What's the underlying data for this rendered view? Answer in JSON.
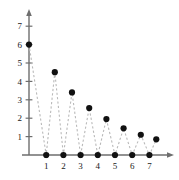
{
  "chart_data": {
    "type": "scatter",
    "title": "",
    "subtitle": "",
    "xlabel": "",
    "ylabel": "",
    "xlim": [
      0,
      7.7
    ],
    "ylim": [
      0,
      7.4
    ],
    "grid": false,
    "legend": null,
    "line_style": "dashed",
    "line_color": "#b9b9b9",
    "marker": "filled-circle",
    "marker_color": "#111111",
    "axis_color": "#6e6e6e",
    "x_ticks": [
      1,
      2,
      3,
      4,
      5,
      6,
      7
    ],
    "x_tick_labels": [
      "1",
      "2",
      "3",
      "4",
      "5",
      "6",
      "7"
    ],
    "y_ticks": [
      1,
      2,
      3,
      4,
      5,
      6,
      7
    ],
    "y_tick_labels": [
      "1",
      "2",
      "3",
      "4",
      "5",
      "6",
      "7"
    ],
    "x": [
      0,
      0.5,
      1,
      1.5,
      2,
      2.5,
      3,
      3.5,
      4,
      4.5,
      5,
      5.5,
      6,
      6.5,
      7,
      7.4
    ],
    "y": [
      6,
      0,
      0,
      4.5,
      0,
      3.4,
      0,
      2.55,
      0,
      1.95,
      0,
      1.45,
      0,
      1.1,
      0,
      0.85
    ],
    "points": [
      {
        "x": 0,
        "y": 6
      },
      {
        "x": 1,
        "y": 0
      },
      {
        "x": 1.5,
        "y": 4.5
      },
      {
        "x": 2,
        "y": 0
      },
      {
        "x": 2.5,
        "y": 3.4
      },
      {
        "x": 3,
        "y": 0
      },
      {
        "x": 3.5,
        "y": 2.55
      },
      {
        "x": 4,
        "y": 0
      },
      {
        "x": 4.5,
        "y": 1.95
      },
      {
        "x": 5,
        "y": 0
      },
      {
        "x": 5.5,
        "y": 1.45
      },
      {
        "x": 6,
        "y": 0
      },
      {
        "x": 6.5,
        "y": 1.1
      },
      {
        "x": 7,
        "y": 0
      },
      {
        "x": 7.4,
        "y": 0.85
      }
    ],
    "path_order": [
      {
        "x": 0,
        "y": 6
      },
      {
        "x": 1,
        "y": 0
      },
      {
        "x": 1.5,
        "y": 4.5
      },
      {
        "x": 2,
        "y": 0
      },
      {
        "x": 2.5,
        "y": 3.4
      },
      {
        "x": 3,
        "y": 0
      },
      {
        "x": 3.5,
        "y": 2.55
      },
      {
        "x": 4,
        "y": 0
      },
      {
        "x": 4.5,
        "y": 1.95
      },
      {
        "x": 5,
        "y": 0
      },
      {
        "x": 5.5,
        "y": 1.45
      },
      {
        "x": 6,
        "y": 0
      },
      {
        "x": 6.5,
        "y": 1.1
      },
      {
        "x": 7,
        "y": 0
      },
      {
        "x": 7.4,
        "y": 0.85
      }
    ]
  },
  "axes": {
    "x_arrow": true,
    "y_arrow": true
  }
}
